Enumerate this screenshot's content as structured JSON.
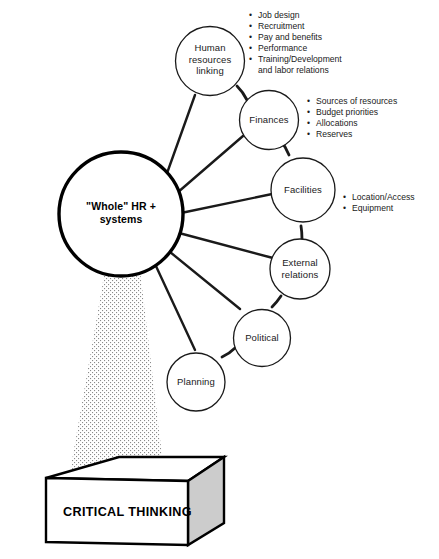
{
  "diagram": {
    "title": "\"Whole\" HR + systems",
    "center_node": {
      "id": "whole-hr-systems",
      "label": "\"Whole\" HR +\nsystems"
    },
    "nodes": [
      {
        "id": "human-resources-linking",
        "label": "Human\nresources\nlinking"
      },
      {
        "id": "finances",
        "label": "Finances"
      },
      {
        "id": "facilities",
        "label": "Facilities"
      },
      {
        "id": "external-relations",
        "label": "External\nrelations"
      },
      {
        "id": "political",
        "label": "Political"
      },
      {
        "id": "planning",
        "label": "Planning"
      }
    ],
    "annotation_lists": [
      {
        "id": "human-resources-linking-details",
        "for_node": "human-resources-linking",
        "items": [
          "Job design",
          "Recruitment",
          "Pay and benefits",
          "Performance",
          "Training/Development\nand labor relations"
        ]
      },
      {
        "id": "finances-details",
        "for_node": "finances",
        "items": [
          "Sources of resources",
          "Budget priorities",
          "Allocations",
          "Reserves"
        ]
      },
      {
        "id": "facilities-details",
        "for_node": "facilities",
        "items": [
          "Location/Access",
          "Equipment"
        ]
      }
    ],
    "foundation": {
      "id": "critical-thinking-block",
      "label": "CRITICAL THINKING"
    },
    "colors": {
      "stroke": "#1a1a1a",
      "center_stroke": "#000000",
      "background": "#ffffff",
      "block_face": "#ffffff",
      "block_side": "#cccccc",
      "stipple": "#7a7a7a"
    }
  }
}
